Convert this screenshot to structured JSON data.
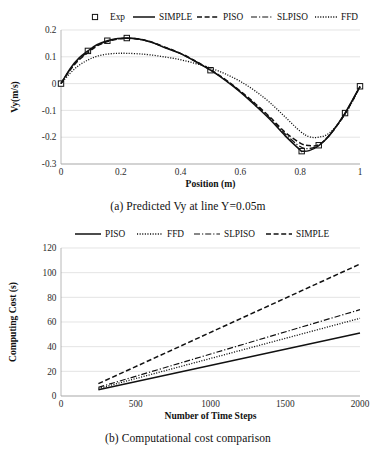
{
  "figure": {
    "panel_a_caption": "(a) Predicted Vy at line Y=0.05m",
    "panel_b_caption": "(b) Computational cost comparison"
  },
  "chart_data": [
    {
      "id": "panel-a",
      "type": "line",
      "title": "",
      "xlabel": "Position (m)",
      "ylabel": "Vy(m/s)",
      "xlim": [
        0,
        1
      ],
      "ylim": [
        -0.3,
        0.2
      ],
      "xticks": [
        "0",
        "0.2",
        "0.4",
        "0.6",
        "0.8",
        "1"
      ],
      "xtick_values": [
        0,
        0.2,
        0.4,
        0.6,
        0.8,
        1
      ],
      "yticks": [
        "0.2",
        "0.1",
        "0",
        "-0.1",
        "-0.2",
        "-0.3"
      ],
      "ytick_values": [
        0.2,
        0.1,
        0,
        -0.1,
        -0.2,
        -0.3
      ],
      "grid": true,
      "legend_position": "top",
      "legend": [
        {
          "label": "Exp",
          "style": "marker-square"
        },
        {
          "label": "SIMPLE",
          "style": "solid"
        },
        {
          "label": "PISO",
          "style": "dashed"
        },
        {
          "label": "SLPISO",
          "style": "dashdot"
        },
        {
          "label": "FFD",
          "style": "dotted"
        }
      ],
      "series": [
        {
          "name": "Exp",
          "style": "marker-square",
          "x": [
            0,
            0.09,
            0.155,
            0.22,
            0.5,
            0.805,
            0.862,
            0.95,
            1
          ],
          "y": [
            0.0,
            0.122,
            0.16,
            0.17,
            0.05,
            -0.252,
            -0.23,
            -0.11,
            -0.01
          ]
        },
        {
          "name": "SIMPLE",
          "style": "solid",
          "x": [
            0,
            0.03,
            0.06,
            0.09,
            0.12,
            0.155,
            0.19,
            0.22,
            0.26,
            0.3,
            0.35,
            0.4,
            0.45,
            0.5,
            0.55,
            0.6,
            0.65,
            0.7,
            0.75,
            0.8,
            0.805,
            0.83,
            0.862,
            0.9,
            0.95,
            1
          ],
          "y": [
            0.0,
            0.055,
            0.095,
            0.122,
            0.145,
            0.16,
            0.168,
            0.17,
            0.166,
            0.155,
            0.133,
            0.112,
            0.082,
            0.05,
            0.012,
            -0.032,
            -0.082,
            -0.135,
            -0.195,
            -0.248,
            -0.252,
            -0.25,
            -0.232,
            -0.19,
            -0.11,
            -0.01
          ]
        },
        {
          "name": "PISO",
          "style": "dashed",
          "x": [
            0,
            0.03,
            0.06,
            0.09,
            0.12,
            0.155,
            0.19,
            0.22,
            0.26,
            0.3,
            0.35,
            0.4,
            0.45,
            0.5,
            0.55,
            0.6,
            0.65,
            0.7,
            0.75,
            0.8,
            0.83,
            0.862,
            0.9,
            0.95,
            1
          ],
          "y": [
            0.0,
            0.05,
            0.088,
            0.115,
            0.14,
            0.157,
            0.166,
            0.169,
            0.166,
            0.156,
            0.135,
            0.113,
            0.084,
            0.052,
            0.015,
            -0.028,
            -0.075,
            -0.126,
            -0.182,
            -0.222,
            -0.231,
            -0.228,
            -0.19,
            -0.112,
            -0.012
          ]
        },
        {
          "name": "SLPISO",
          "style": "dashdot",
          "x": [
            0,
            0.03,
            0.06,
            0.09,
            0.12,
            0.155,
            0.19,
            0.22,
            0.26,
            0.3,
            0.35,
            0.4,
            0.45,
            0.5,
            0.55,
            0.6,
            0.65,
            0.7,
            0.75,
            0.8,
            0.83,
            0.862,
            0.9,
            0.95,
            1
          ],
          "y": [
            0.0,
            0.052,
            0.09,
            0.118,
            0.142,
            0.158,
            0.167,
            0.169,
            0.165,
            0.155,
            0.134,
            0.112,
            0.083,
            0.051,
            0.013,
            -0.03,
            -0.078,
            -0.13,
            -0.188,
            -0.235,
            -0.242,
            -0.23,
            -0.19,
            -0.111,
            -0.011
          ]
        },
        {
          "name": "FFD",
          "style": "dotted",
          "x": [
            0,
            0.03,
            0.06,
            0.09,
            0.12,
            0.155,
            0.19,
            0.22,
            0.26,
            0.3,
            0.35,
            0.4,
            0.45,
            0.5,
            0.55,
            0.6,
            0.65,
            0.7,
            0.75,
            0.8,
            0.83,
            0.862,
            0.9,
            0.95,
            1
          ],
          "y": [
            0.0,
            0.038,
            0.068,
            0.088,
            0.102,
            0.11,
            0.113,
            0.113,
            0.111,
            0.107,
            0.099,
            0.089,
            0.075,
            0.058,
            0.036,
            0.008,
            -0.028,
            -0.072,
            -0.125,
            -0.178,
            -0.198,
            -0.2,
            -0.182,
            -0.115,
            -0.012
          ]
        }
      ]
    },
    {
      "id": "panel-b",
      "type": "line",
      "title": "",
      "xlabel": "Number of Time Steps",
      "ylabel": "Computing Cost (s)",
      "xlim": [
        0,
        2000
      ],
      "ylim": [
        0,
        120
      ],
      "xticks": [
        "0",
        "500",
        "1000",
        "1500",
        "2000"
      ],
      "xtick_values": [
        0,
        500,
        1000,
        1500,
        2000
      ],
      "yticks": [
        "0",
        "20",
        "40",
        "60",
        "80",
        "100",
        "120"
      ],
      "ytick_values": [
        0,
        20,
        40,
        60,
        80,
        100,
        120
      ],
      "grid": true,
      "legend_position": "top",
      "legend": [
        {
          "label": "PISO",
          "style": "solid"
        },
        {
          "label": "FFD",
          "style": "dotted"
        },
        {
          "label": "SLPISO",
          "style": "dashdot"
        },
        {
          "label": "SIMPLE",
          "style": "dashed"
        }
      ],
      "series": [
        {
          "name": "PISO",
          "style": "solid",
          "x": [
            250,
            2000
          ],
          "y": [
            5,
            51
          ]
        },
        {
          "name": "FFD",
          "style": "dotted",
          "x": [
            250,
            2000
          ],
          "y": [
            6,
            63
          ]
        },
        {
          "name": "SLPISO",
          "style": "dashdot",
          "x": [
            250,
            2000
          ],
          "y": [
            7,
            70
          ]
        },
        {
          "name": "SIMPLE",
          "style": "dashed",
          "x": [
            250,
            2000
          ],
          "y": [
            10,
            107
          ]
        }
      ]
    }
  ]
}
